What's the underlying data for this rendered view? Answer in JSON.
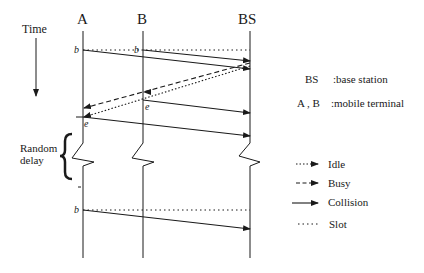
{
  "axis": {
    "time_label": "Time"
  },
  "nodes": {
    "A": "A",
    "B": "B",
    "BS": "BS"
  },
  "markers": {
    "begin": "b",
    "end": "e"
  },
  "random_delay": {
    "line1": "Random",
    "line2": "delay"
  },
  "key": {
    "bs_abbr": "BS",
    "bs_desc": ":base station",
    "ab_abbr": "A , B",
    "ab_desc": ":mobile terminal"
  },
  "legend": [
    {
      "label": "Idle",
      "style": "dotted-arrow"
    },
    {
      "label": "Busy",
      "style": "dashed-arrow"
    },
    {
      "label": "Collision",
      "style": "solid-arrow"
    },
    {
      "label": "Slot",
      "style": "dotted"
    }
  ]
}
